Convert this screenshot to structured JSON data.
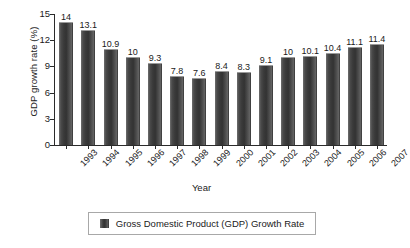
{
  "chart_data": {
    "type": "bar",
    "title": "",
    "xlabel": "Year",
    "ylabel": "GDP growth rate (%)",
    "categories": [
      "1993",
      "1994",
      "1995",
      "1996",
      "1997",
      "1998",
      "1999",
      "2000",
      "2001",
      "2002",
      "2003",
      "2004",
      "2005",
      "2006",
      "2007"
    ],
    "values": [
      14,
      13.1,
      10.9,
      10,
      9.3,
      7.8,
      7.6,
      8.4,
      8.3,
      9.1,
      10,
      10.1,
      10.4,
      11.1,
      11.4
    ],
    "value_labels": [
      "14",
      "13.1",
      "10.9",
      "10",
      "9.3",
      "7.8",
      "7.6",
      "8.4",
      "8.3",
      "9.1",
      "10",
      "10.1",
      "10.4",
      "11.1",
      "11.4"
    ],
    "ylim": [
      0,
      15
    ],
    "yticks": [
      0,
      3,
      6,
      9,
      12,
      15
    ],
    "ytick_labels": [
      "0",
      "3",
      "6",
      "9",
      "12",
      "15"
    ],
    "grid": false,
    "legend_position": "bottom-center",
    "series": [
      {
        "name": "Gross Domestic Product (GDP) Growth Rate",
        "color": "#3a3a3a",
        "values": [
          14,
          13.1,
          10.9,
          10,
          9.3,
          7.8,
          7.6,
          8.4,
          8.3,
          9.1,
          10,
          10.1,
          10.4,
          11.1,
          11.4
        ]
      }
    ]
  },
  "legend": {
    "entries": [
      {
        "label": "Gross Domestic Product (GDP) Growth Rate",
        "color": "#3a3a3a"
      }
    ]
  },
  "colors": {
    "bar_dark": "#333333",
    "bar_highlight": "#6f6f6f",
    "axis": "#2b2b2b",
    "text": "#1a1a1a",
    "legend_border": "#a8a8a8",
    "background": "#ffffff"
  }
}
